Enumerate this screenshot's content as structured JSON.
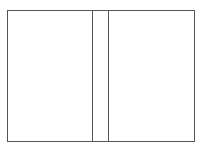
{
  "diagram": {
    "type": "book-cover-layout",
    "stroke_color": "#555555",
    "background": "#ffffff",
    "panels": [
      {
        "name": "back-cover",
        "x": 7,
        "y": 10,
        "w": 86,
        "h": 132
      },
      {
        "name": "spine",
        "x": 92,
        "y": 10,
        "w": 18,
        "h": 132
      },
      {
        "name": "front-cover",
        "x": 109,
        "y": 10,
        "w": 86,
        "h": 132
      }
    ]
  }
}
